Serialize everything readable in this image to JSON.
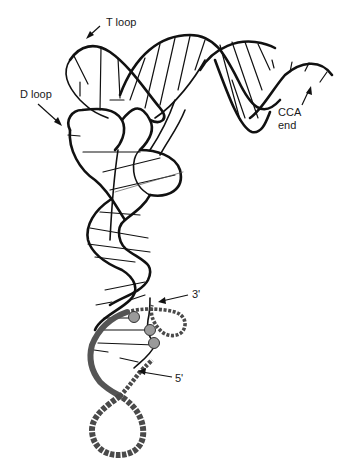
{
  "figure": {
    "labels": {
      "t_loop": "T loop",
      "d_loop": "D loop",
      "cca_end_line1": "CCA",
      "cca_end_line2": "end",
      "three_prime": "3'",
      "five_prime": "5'"
    },
    "colors": {
      "line": "#111111",
      "mrna_strand": "#4a4a4a",
      "base_pair_circle": "#9a9a9a",
      "background": "#ffffff"
    },
    "base_pairs_shown": 3
  }
}
